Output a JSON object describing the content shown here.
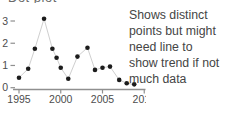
{
  "partial_title": {
    "text": "Dot plot"
  },
  "annotation": {
    "full_text": "Shows distinct points but might need line to show trend if not much data",
    "lines": [
      "Shows distinct",
      "points but might",
      "need line to",
      "show trend if not",
      "much data"
    ]
  },
  "chart_data": {
    "type": "scatter",
    "connected_by_line": true,
    "x": [
      1995,
      1996.1,
      1996.9,
      1998,
      1999,
      1999.5,
      2000,
      2000.9,
      2002,
      2003.2,
      2004.1,
      2005,
      2005.9,
      2007,
      2007.9,
      2008.8
    ],
    "values": [
      0.45,
      0.85,
      1.75,
      3.1,
      1.75,
      1.35,
      0.9,
      0.4,
      1.4,
      1.8,
      0.8,
      0.9,
      0.95,
      0.35,
      0.2,
      0.15
    ],
    "x_ticks": [
      1995,
      2000,
      2005,
      2010
    ],
    "y_ticks": [
      0,
      1,
      2,
      3
    ],
    "xlim": [
      1994.3,
      2010.2
    ],
    "ylim": [
      0,
      3.3
    ],
    "xlabel": "",
    "ylabel": "",
    "grid": "off",
    "legend": "none",
    "annotation": "Shows distinct points but might need line to show trend if not much data",
    "point_color": "#1c1c1c",
    "line_color": "#cfcfcf",
    "axis_color": "#8f8f8f",
    "tick_label_color": "#4d4d4d"
  }
}
